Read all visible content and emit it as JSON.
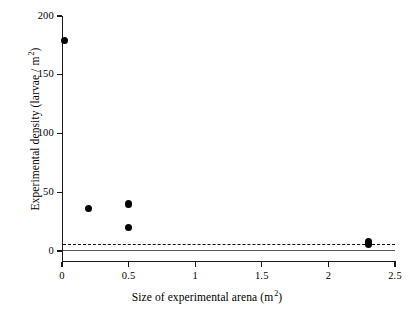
{
  "chart_data": {
    "type": "scatter",
    "title": "",
    "xlabel_parts": {
      "text": "Size of experimental arena (m",
      "sup": "2",
      "tail": ")"
    },
    "ylabel_parts": {
      "text": "Experimental density (larvae / m",
      "sup": "2",
      "tail": ")"
    },
    "xlabel": "Size of experimental arena (m2)",
    "ylabel": "Experimental density (larvae / m2)",
    "xlim": [
      0,
      2.5
    ],
    "ylim": [
      0,
      200
    ],
    "xticks": [
      0,
      0.5,
      1,
      1.5,
      2,
      2.5
    ],
    "xtick_labels": [
      "0",
      "0.5",
      "1",
      "1.5",
      "2",
      "2.5"
    ],
    "yticks": [
      0,
      50,
      100,
      150,
      200
    ],
    "ytick_labels": [
      "0",
      "50",
      "100",
      "150",
      "200"
    ],
    "grid": false,
    "legend": null,
    "marker": "filled-circle",
    "marker_color": "#000000",
    "points": [
      {
        "x": 0.02,
        "y": 179
      },
      {
        "x": 0.2,
        "y": 36
      },
      {
        "x": 0.5,
        "y": 40
      },
      {
        "x": 0.5,
        "y": 20
      },
      {
        "x": 2.3,
        "y": 8
      },
      {
        "x": 2.3,
        "y": 6
      }
    ],
    "reference_lines": [
      {
        "name": "dashed-reference-line",
        "y": 6,
        "style": "dashed",
        "color": "#111111"
      },
      {
        "name": "solid-reference-line",
        "y": 0.5,
        "style": "solid",
        "color": "#555555"
      }
    ]
  },
  "figure": {
    "background": "#ffffff",
    "axis_color": "#1a1a1a"
  }
}
